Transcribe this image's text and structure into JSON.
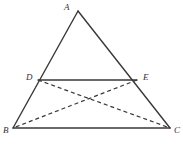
{
  "figure": {
    "canvas": {
      "width": 183,
      "height": 146,
      "background": "#ffffff"
    },
    "stroke_color": "#3a3836",
    "label_color": "#33312f",
    "solid_stroke_width": 1.4,
    "dashed_stroke_width": 1.2,
    "dash_pattern": "4,3"
  },
  "points": {
    "A": {
      "label": "A",
      "x": 78,
      "y": 11,
      "label_x": 64,
      "label_y": 3
    },
    "B": {
      "label": "B",
      "x": 13,
      "y": 128,
      "label_x": 3,
      "label_y": 126
    },
    "C": {
      "label": "C",
      "x": 170,
      "y": 128,
      "label_x": 174,
      "label_y": 126
    },
    "D": {
      "label": "D",
      "x": 38,
      "y": 80,
      "label_x": 26,
      "label_y": 73
    },
    "E": {
      "label": "E",
      "x": 137,
      "y": 80,
      "label_x": 143,
      "label_y": 73
    },
    "X": {
      "label": "",
      "x": 88,
      "y": 98,
      "label_x": 88,
      "label_y": 98
    }
  },
  "segments": {
    "solid": [
      {
        "name": "side-ab",
        "from": "A",
        "to": "B"
      },
      {
        "name": "side-ac",
        "from": "A",
        "to": "C"
      },
      {
        "name": "side-bc",
        "from": "B",
        "to": "C"
      },
      {
        "name": "midsegment-de",
        "from": "D",
        "to": "E"
      }
    ],
    "dashed": [
      {
        "name": "cevian-dc",
        "from": "D",
        "to": "C"
      },
      {
        "name": "cevian-eb",
        "from": "E",
        "to": "B"
      }
    ]
  }
}
